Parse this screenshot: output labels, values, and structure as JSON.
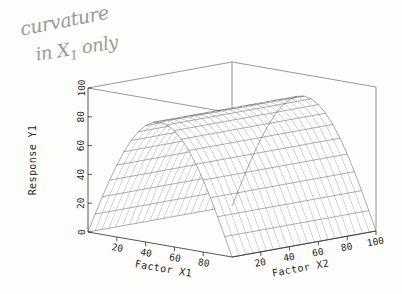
{
  "annotation": {
    "line1": "curvature",
    "line2_pre": "in X",
    "line2_sub": "1",
    "line2_post": " only",
    "color": "#9a9a96"
  },
  "chart_data": {
    "type": "surface",
    "title": "",
    "xlabel": "Factor X1",
    "ylabel": "Factor X2",
    "zlabel": "Response Y1",
    "x1_label": "Factor X1",
    "x2_label": "Factor X2",
    "y_label": "Response Y1",
    "x1_ticks": [
      20,
      40,
      60,
      80
    ],
    "x2_ticks": [
      20,
      40,
      60,
      80,
      100
    ],
    "y_ticks": [
      0,
      20,
      40,
      60,
      80,
      100
    ],
    "x1_range": [
      0,
      100
    ],
    "x2_range": [
      0,
      100
    ],
    "y_range": [
      0,
      100
    ],
    "grid": false,
    "legend": "none",
    "surface_color": "#1f1f1f",
    "background": "#ffffff",
    "model": "Y1 = 85 * sin(pi * X1 / 100)",
    "x1_samples": [
      0,
      5,
      10,
      15,
      20,
      25,
      30,
      35,
      40,
      45,
      50,
      55,
      60,
      65,
      70,
      75,
      80,
      85,
      90,
      95,
      100
    ],
    "x2_samples": [
      0,
      5,
      10,
      15,
      20,
      25,
      30,
      35,
      40,
      45,
      50,
      55,
      60,
      65,
      70,
      75,
      80,
      85,
      90,
      95,
      100
    ],
    "z_profile_along_x1": [
      0,
      13.3,
      26.3,
      38.5,
      50.0,
      60.1,
      68.8,
      75.6,
      80.8,
      84.0,
      85.0,
      84.0,
      80.8,
      75.6,
      68.8,
      60.1,
      50.0,
      38.5,
      26.3,
      13.3,
      0
    ],
    "z_profile_along_x2": [
      85,
      85,
      85,
      85,
      85,
      85,
      85,
      85,
      85,
      85,
      85,
      85,
      85,
      85,
      85,
      85,
      85,
      85,
      85,
      85,
      85
    ]
  },
  "view": {
    "azimuth_hint": "front-left origin, X1 to lower-left, X2 to lower-right",
    "mesh_density": 21
  }
}
